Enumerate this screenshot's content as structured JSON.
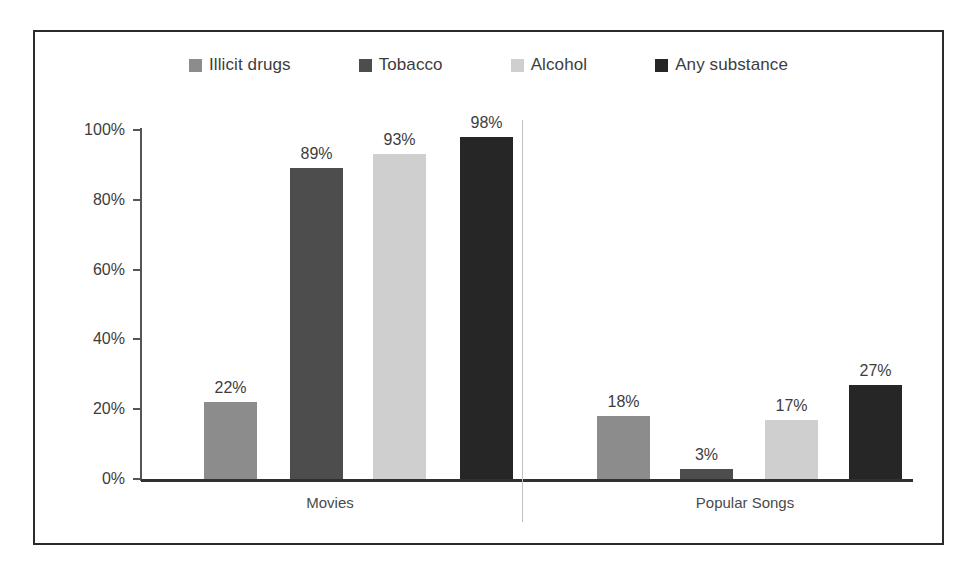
{
  "chart_data": {
    "type": "bar",
    "title": "",
    "subtitle": "",
    "xlabel": "",
    "ylabel": "",
    "categories": [
      "Movies",
      "Popular Songs"
    ],
    "series": [
      {
        "name": "Illicit drugs",
        "color": "#8c8c8c",
        "values": [
          22,
          89
        ],
        "labels": [
          "22%",
          "89%"
        ]
      },
      {
        "name": "Tobacco",
        "color": "#4d4d4d",
        "values": [
          89,
          3
        ],
        "labels": [
          "89%",
          "3%"
        ]
      },
      {
        "name": "Alcohol",
        "color": "#cfcfcf",
        "values": [
          93,
          17
        ],
        "labels": [
          "93%",
          "17%"
        ]
      },
      {
        "name": "Any substance",
        "color": "#262626",
        "values": [
          98,
          27
        ],
        "labels": [
          "98%",
          "27%"
        ]
      }
    ],
    "ylim": [
      0,
      100
    ],
    "y_ticks": [
      0,
      20,
      40,
      60,
      80,
      100
    ],
    "y_tick_labels": [
      "0%",
      "20%",
      "40%",
      "60%",
      "80%",
      "100%"
    ],
    "grid": false,
    "legend_position": "top",
    "value_labels_shown": true,
    "units": "percent"
  },
  "legend": {
    "items": [
      {
        "label": "Illicit drugs",
        "color": "#8c8c8c"
      },
      {
        "label": "Tobacco",
        "color": "#4d4d4d"
      },
      {
        "label": "Alcohol",
        "color": "#cfcfcf"
      },
      {
        "label": "Any substance",
        "color": "#262626"
      }
    ]
  },
  "axes": {
    "y_tick_labels": [
      "100%",
      "80%",
      "60%",
      "40%",
      "20%",
      "0%"
    ],
    "category_labels": [
      "Movies",
      "Popular Songs"
    ]
  },
  "bars": [
    {
      "group": "Movies",
      "series": "Illicit drugs",
      "value": 22,
      "label": "22%",
      "color": "#8c8c8c"
    },
    {
      "group": "Movies",
      "series": "Tobacco",
      "value": 89,
      "label": "89%",
      "color": "#4d4d4d"
    },
    {
      "group": "Movies",
      "series": "Alcohol",
      "value": 93,
      "label": "93%",
      "color": "#cfcfcf"
    },
    {
      "group": "Movies",
      "series": "Any substance",
      "value": 98,
      "label": "98%",
      "color": "#262626"
    },
    {
      "group": "Popular Songs",
      "series": "Illicit drugs",
      "value": 18,
      "label": "18%",
      "color": "#8c8c8c"
    },
    {
      "group": "Popular Songs",
      "series": "Tobacco",
      "value": 3,
      "label": "3%",
      "color": "#4d4d4d"
    },
    {
      "group": "Popular Songs",
      "series": "Alcohol",
      "value": 17,
      "label": "17%",
      "color": "#cfcfcf"
    },
    {
      "group": "Popular Songs",
      "series": "Any substance",
      "value": 27,
      "label": "27%",
      "color": "#262626"
    }
  ]
}
